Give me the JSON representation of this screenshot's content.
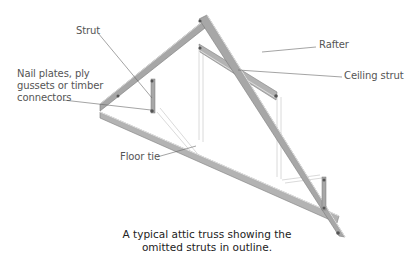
{
  "diagram": {
    "labels": {
      "strut": "Strut",
      "nail_plates_line1": "Nail plates, ply",
      "nail_plates_line2": "gussets or timber",
      "nail_plates_line3": "connectors",
      "rafter": "Rafter",
      "ceiling_strut": "Ceiling strut",
      "floor_tie": "Floor tie"
    },
    "caption_line1": "A typical attic truss showing the",
    "caption_line2": "omitted struts in outline.",
    "colors": {
      "timber": "#a9a9a9",
      "timber_edge": "#7a7a7a",
      "timber_light": "#d4d4d4",
      "outline_strut": "#cfcfcf",
      "leader": "#666666",
      "text": "#555555"
    }
  }
}
